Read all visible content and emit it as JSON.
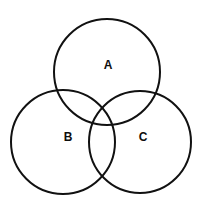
{
  "figure": {
    "type": "venn-diagram",
    "set_count": 3,
    "background_color": "#ffffff",
    "stroke_color": "#111111",
    "label_color": "#0d0d0d",
    "stroke_width": 2,
    "width": 204,
    "height": 205
  },
  "chart_data": {
    "type": "diagram",
    "subtype": "venn",
    "title": "",
    "xlabel": "",
    "ylabel": "",
    "grid": false,
    "legend": "none",
    "sets": [
      {
        "label": "A",
        "position": "top",
        "center_x": 107,
        "center_y": 72,
        "radius": 53,
        "label_x": 108,
        "label_y": 66
      },
      {
        "label": "B",
        "position": "bottom-left",
        "center_x": 63,
        "center_y": 142,
        "radius": 52,
        "label_x": 68,
        "label_y": 138
      },
      {
        "label": "C",
        "position": "bottom-right",
        "center_x": 140,
        "center_y": 142,
        "radius": 51,
        "label_x": 143,
        "label_y": 138
      }
    ],
    "regions": [
      "A",
      "B",
      "C",
      "A∩B",
      "A∩C",
      "B∩C",
      "A∩B∩C"
    ],
    "region_values": []
  }
}
